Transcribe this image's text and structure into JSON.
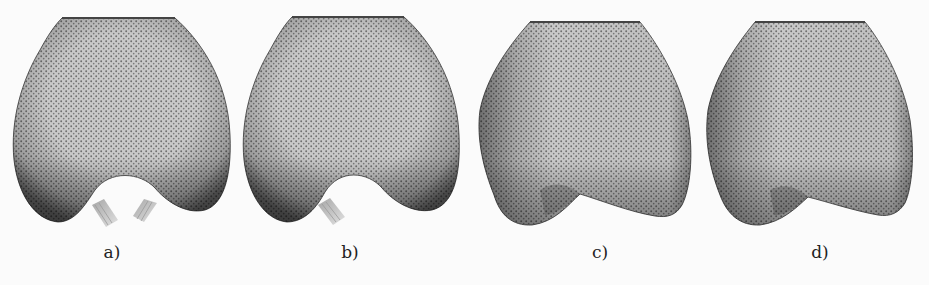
{
  "figure": {
    "panels": [
      {
        "id": "a",
        "label": "a)",
        "connectors": 2,
        "shape": "rounded-bilobed"
      },
      {
        "id": "b",
        "label": "b)",
        "connectors": 1,
        "shape": "rounded-bilobed"
      },
      {
        "id": "c",
        "label": "c)",
        "connectors": 0,
        "shape": "angular-bilobed"
      },
      {
        "id": "d",
        "label": "d)",
        "connectors": 0,
        "shape": "angular-bilobed"
      }
    ],
    "colors": {
      "background": "#fbfbfb",
      "mesh_base": "#c4c4c4",
      "mesh_dot": "#6a6a6a",
      "edge_shadow": "#4a4a4a",
      "label_text": "#222222"
    }
  }
}
